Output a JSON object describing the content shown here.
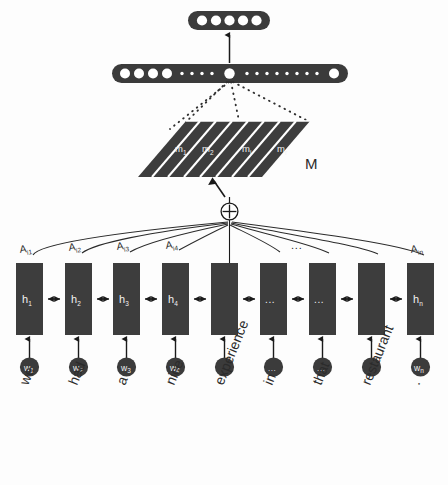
{
  "figure": {
    "type": "neural-network-architecture-diagram"
  },
  "output_layer": {
    "name": "output-layer",
    "node_count": 5,
    "fill": "#3b3b3b",
    "node_fill": "#ffffff"
  },
  "hidden_layer": {
    "name": "representation-layer",
    "fill": "#3b3b3b",
    "large_node_count": 6,
    "small_dot_count": 10,
    "highlighted_node_index": 4
  },
  "memory_matrix": {
    "name": "memory-matrix",
    "label": "M",
    "cells": [
      "m₁",
      "m₂",
      "mᵢ",
      "mᵣ"
    ],
    "cell_plain": [
      "m1",
      "m2",
      "mi",
      "mr"
    ],
    "fill": "#3d3d3d",
    "stripe": "#ffffff",
    "slice_count": 8
  },
  "sum_node": {
    "name": "sum-node",
    "symbol": "+",
    "stroke": "#1a1a1a"
  },
  "attention": {
    "name": "attention-weights",
    "labels": [
      "A",
      "A",
      "A",
      "A",
      "A"
    ],
    "full_labels": [
      "A i1",
      "A i2",
      "A i3",
      "A i4",
      "A in"
    ],
    "bases": [
      "A",
      "A",
      "A",
      "A",
      "A"
    ],
    "subs": [
      "i1",
      "i2",
      "i3",
      "i4",
      "in"
    ],
    "ellipsis": "...",
    "stroke": "#2b2b2b"
  },
  "rnn": {
    "name": "bidirectional-rnn-cells",
    "cell_fill": "#3d3d3d",
    "cell_count": 9,
    "cells": [
      {
        "base": "h",
        "sub": "1",
        "text": "h₁"
      },
      {
        "base": "h",
        "sub": "2",
        "text": "h₂"
      },
      {
        "base": "h",
        "sub": "3",
        "text": "h₃"
      },
      {
        "base": "h",
        "sub": "4",
        "text": "h₄"
      },
      {
        "base": "",
        "sub": "",
        "text": ""
      },
      {
        "base": "...",
        "sub": "",
        "text": "..."
      },
      {
        "base": "...",
        "sub": "",
        "text": "..."
      },
      {
        "base": "",
        "sub": "",
        "text": ""
      },
      {
        "base": "h",
        "sub": "n",
        "text": "hₙ"
      }
    ]
  },
  "inputs": {
    "name": "word-embeddings",
    "circle_fill": "#3b3b3b",
    "tokens": [
      {
        "word": "we",
        "base": "w",
        "sub": "1",
        "node": "w₁"
      },
      {
        "word": "had",
        "base": "w",
        "sub": "2",
        "node": "w₂"
      },
      {
        "word": "a",
        "base": "w",
        "sub": "3",
        "node": "w₃"
      },
      {
        "word": "nice",
        "base": "w",
        "sub": "4",
        "node": "w₄"
      },
      {
        "word": "experience",
        "base": "",
        "sub": "",
        "node": ""
      },
      {
        "word": "in",
        "base": "...",
        "sub": "",
        "node": "..."
      },
      {
        "word": "that",
        "base": "...",
        "sub": "",
        "node": "..."
      },
      {
        "word": "restaurant",
        "base": "",
        "sub": "",
        "node": ""
      },
      {
        "word": ".",
        "base": "w",
        "sub": "n",
        "node": "wₙ"
      }
    ]
  },
  "colors": {
    "ink": "#2b2b2b",
    "dark_fill": "#3b3b3b",
    "cell_fill": "#3d3d3d",
    "white": "#ffffff",
    "background": "#fdfdfd"
  }
}
